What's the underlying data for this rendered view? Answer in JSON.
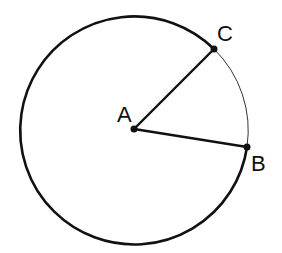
{
  "diagram": {
    "type": "circle-sector",
    "center": {
      "label": "A",
      "x": 134,
      "y": 129
    },
    "radius": 114,
    "points": [
      {
        "label": "B",
        "x": 247,
        "y": 147
      },
      {
        "label": "C",
        "x": 214,
        "y": 49
      }
    ],
    "segments": [
      "AB",
      "AC"
    ],
    "minor_arc": "CB (thin stroke)",
    "major_arc": "thick stroke",
    "colors": {
      "stroke": "#111111",
      "background": "#ffffff"
    }
  },
  "labels": {
    "A": "A",
    "B": "B",
    "C": "C"
  }
}
